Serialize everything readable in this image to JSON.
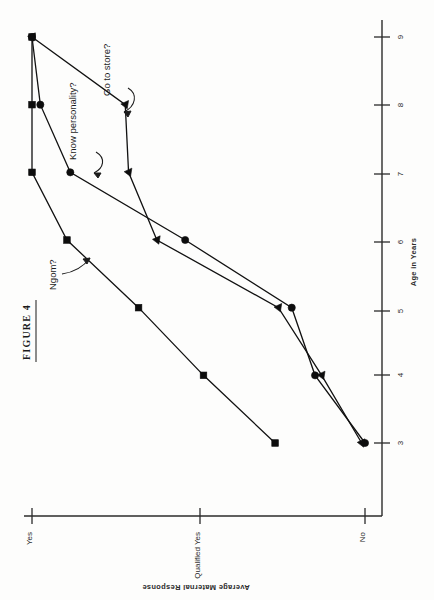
{
  "figure": {
    "title": "FIGURE 4"
  },
  "chart_data": {
    "type": "line",
    "title": "FIGURE 4",
    "orientation": "rotated-90-ccw",
    "xlabel": "Age in Years",
    "ylabel": "Average Maternal Response",
    "x": [
      3,
      4,
      5,
      6,
      7,
      8,
      9
    ],
    "x_tick_labels": [
      "3",
      "4",
      "5",
      "6",
      "7",
      "8",
      "9"
    ],
    "xlim": [
      3,
      9
    ],
    "y_tick_labels": [
      "Yes",
      "Qualified Yes",
      "No"
    ],
    "y_tick_values": [
      2,
      1,
      0
    ],
    "ylim": [
      0,
      2
    ],
    "grid": false,
    "legend": "annotations",
    "series": [
      {
        "name": "Ngom?",
        "marker": "square",
        "values": [
          0.54,
          0.97,
          1.36,
          1.79,
          2.0,
          2.0,
          2.0
        ]
      },
      {
        "name": "Know personality?",
        "marker": "circle",
        "values": [
          0.0,
          0.3,
          0.44,
          1.08,
          1.77,
          1.95,
          2.0
        ]
      },
      {
        "name": "Go to store?",
        "marker": "triangle",
        "values": [
          0.02,
          0.26,
          0.52,
          1.25,
          1.42,
          1.44,
          2.0
        ]
      }
    ],
    "annotations": [
      {
        "text": "Ngom?",
        "target_x": 5.7,
        "target_y": 1.58
      },
      {
        "text": "Know personality?",
        "target_x": 7.0,
        "target_y": 1.77
      },
      {
        "text": "Go to store?",
        "target_x": 7.95,
        "target_y": 1.44
      }
    ]
  },
  "axes": {
    "x_axis_name": "Age in Years",
    "y_axis_name": "Average Maternal Response"
  }
}
